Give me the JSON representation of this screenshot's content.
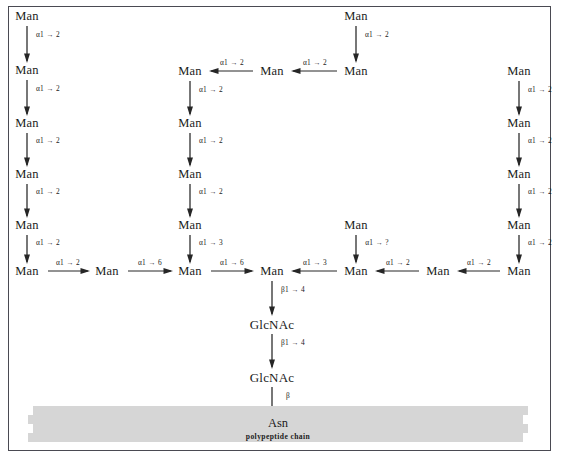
{
  "figure": {
    "frame_color": "#4a4a52",
    "background_color": "#ffffff",
    "text_color": "#1b1b1b",
    "polypeptide_bar_color": "#d6d6d6"
  },
  "polypeptide": {
    "asn_label": "Asn",
    "chain_label": "polypeptide chain"
  },
  "residues": [
    {
      "id": "L1",
      "label": "Man",
      "x": 27,
      "y": 16
    },
    {
      "id": "L2",
      "label": "Man",
      "x": 27,
      "y": 70
    },
    {
      "id": "L3",
      "label": "Man",
      "x": 27,
      "y": 123
    },
    {
      "id": "L4",
      "label": "Man",
      "x": 27,
      "y": 174
    },
    {
      "id": "L5",
      "label": "Man",
      "x": 27,
      "y": 225
    },
    {
      "id": "L6",
      "label": "Man",
      "x": 27,
      "y": 271
    },
    {
      "id": "B1",
      "label": "Man",
      "x": 107,
      "y": 271
    },
    {
      "id": "M1",
      "label": "Man",
      "x": 190,
      "y": 71
    },
    {
      "id": "M2",
      "label": "Man",
      "x": 190,
      "y": 123
    },
    {
      "id": "M3",
      "label": "Man",
      "x": 190,
      "y": 174
    },
    {
      "id": "M4",
      "label": "Man",
      "x": 190,
      "y": 225
    },
    {
      "id": "M5",
      "label": "Man",
      "x": 190,
      "y": 271
    },
    {
      "id": "T1",
      "label": "Man",
      "x": 272,
      "y": 71
    },
    {
      "id": "T2",
      "label": "Man",
      "x": 356,
      "y": 71
    },
    {
      "id": "T0",
      "label": "Man",
      "x": 356,
      "y": 16
    },
    {
      "id": "C1",
      "label": "Man",
      "x": 272,
      "y": 271
    },
    {
      "id": "C2",
      "label": "GlcNAc",
      "x": 272,
      "y": 324
    },
    {
      "id": "C3",
      "label": "GlcNAc",
      "x": 272,
      "y": 377
    },
    {
      "id": "R1",
      "label": "Man",
      "x": 356,
      "y": 271
    },
    {
      "id": "R0",
      "label": "Man",
      "x": 356,
      "y": 225
    },
    {
      "id": "R2",
      "label": "Man",
      "x": 438,
      "y": 271
    },
    {
      "id": "RR1",
      "label": "Man",
      "x": 519,
      "y": 271
    },
    {
      "id": "RR2",
      "label": "Man",
      "x": 519,
      "y": 225
    },
    {
      "id": "RR3",
      "label": "Man",
      "x": 519,
      "y": 174
    },
    {
      "id": "RR4",
      "label": "Man",
      "x": 519,
      "y": 123
    },
    {
      "id": "RR5",
      "label": "Man",
      "x": 519,
      "y": 71
    }
  ],
  "linkages": [
    {
      "from": "L1",
      "to": "L2",
      "label": "α1 → 2",
      "dir": "down",
      "x1": 27,
      "y1": 26,
      "x2": 27,
      "y2": 61,
      "lx": 48,
      "ly": 35
    },
    {
      "from": "L2",
      "to": "L3",
      "label": "α1 → 2",
      "dir": "down",
      "x1": 27,
      "y1": 80,
      "x2": 27,
      "y2": 114,
      "lx": 48,
      "ly": 89
    },
    {
      "from": "L3",
      "to": "L4",
      "label": "α1 → 2",
      "dir": "down",
      "x1": 27,
      "y1": 133,
      "x2": 27,
      "y2": 165,
      "lx": 48,
      "ly": 141
    },
    {
      "from": "L4",
      "to": "L5",
      "label": "α1 → 2",
      "dir": "down",
      "x1": 27,
      "y1": 184,
      "x2": 27,
      "y2": 216,
      "lx": 48,
      "ly": 192
    },
    {
      "from": "L5",
      "to": "L6",
      "label": "α1 → 2",
      "dir": "down",
      "x1": 27,
      "y1": 235,
      "x2": 27,
      "y2": 262,
      "lx": 48,
      "ly": 243
    },
    {
      "from": "L6",
      "to": "B1",
      "label": "α1 → 2",
      "dir": "right",
      "x1": 48,
      "y1": 271,
      "x2": 88,
      "y2": 271,
      "lx": 68,
      "ly": 263
    },
    {
      "from": "B1",
      "to": "M5",
      "label": "α1 → 6",
      "dir": "right",
      "x1": 128,
      "y1": 271,
      "x2": 171,
      "y2": 271,
      "lx": 150,
      "ly": 263
    },
    {
      "from": "M5",
      "to": "C1",
      "label": "α1 → 6",
      "dir": "right",
      "x1": 211,
      "y1": 271,
      "x2": 252,
      "y2": 271,
      "lx": 232,
      "ly": 263
    },
    {
      "from": "M1",
      "to": "M2",
      "label": "α1 → 2",
      "dir": "down",
      "x1": 190,
      "y1": 81,
      "x2": 190,
      "y2": 114,
      "lx": 211,
      "ly": 90
    },
    {
      "from": "M2",
      "to": "M3",
      "label": "α1 → 2",
      "dir": "down",
      "x1": 190,
      "y1": 133,
      "x2": 190,
      "y2": 165,
      "lx": 211,
      "ly": 141
    },
    {
      "from": "M3",
      "to": "M4",
      "label": "α1 → 2",
      "dir": "down",
      "x1": 190,
      "y1": 184,
      "x2": 190,
      "y2": 216,
      "lx": 211,
      "ly": 192
    },
    {
      "from": "M4",
      "to": "M5",
      "label": "α1 → 3",
      "dir": "down",
      "x1": 190,
      "y1": 235,
      "x2": 190,
      "y2": 262,
      "lx": 211,
      "ly": 243
    },
    {
      "from": "T1",
      "to": "M1",
      "label": "α1 → 2",
      "dir": "left",
      "x1": 253,
      "y1": 71,
      "x2": 211,
      "y2": 71,
      "lx": 232,
      "ly": 63
    },
    {
      "from": "T2",
      "to": "T1",
      "label": "α1 → 2",
      "dir": "left",
      "x1": 337,
      "y1": 71,
      "x2": 293,
      "y2": 71,
      "lx": 315,
      "ly": 63
    },
    {
      "from": "T0",
      "to": "T2",
      "label": "α1 → 2",
      "dir": "down",
      "x1": 356,
      "y1": 26,
      "x2": 356,
      "y2": 61,
      "lx": 377,
      "ly": 35
    },
    {
      "from": "C1",
      "to": "C2",
      "label": "β1 → 4",
      "dir": "down",
      "x1": 272,
      "y1": 281,
      "x2": 272,
      "y2": 314,
      "lx": 293,
      "ly": 290
    },
    {
      "from": "C2",
      "to": "C3",
      "label": "β1 → 4",
      "dir": "down",
      "x1": 272,
      "y1": 334,
      "x2": 272,
      "y2": 367,
      "lx": 293,
      "ly": 343
    },
    {
      "from": "C3",
      "to": "Asn",
      "label": "β",
      "dir": "down",
      "x1": 272,
      "y1": 387,
      "x2": 272,
      "y2": 414,
      "lx": 288,
      "ly": 396
    },
    {
      "from": "R1",
      "to": "C1",
      "label": "α1 → 3",
      "dir": "left",
      "x1": 337,
      "y1": 271,
      "x2": 293,
      "y2": 271,
      "lx": 315,
      "ly": 263
    },
    {
      "from": "R0",
      "to": "R1",
      "label": "α1 → ?",
      "dir": "down",
      "x1": 356,
      "y1": 235,
      "x2": 356,
      "y2": 262,
      "lx": 377,
      "ly": 243
    },
    {
      "from": "R2",
      "to": "R1",
      "label": "α1 → 2",
      "dir": "left",
      "x1": 419,
      "y1": 271,
      "x2": 377,
      "y2": 271,
      "lx": 398,
      "ly": 263
    },
    {
      "from": "RR1",
      "to": "R2",
      "label": "α1 → 2",
      "dir": "left",
      "x1": 500,
      "y1": 271,
      "x2": 459,
      "y2": 271,
      "lx": 479,
      "ly": 263
    },
    {
      "from": "RR5",
      "to": "RR4",
      "label": "α1 → 2",
      "dir": "down",
      "x1": 519,
      "y1": 81,
      "x2": 519,
      "y2": 114,
      "lx": 540,
      "ly": 90
    },
    {
      "from": "RR4",
      "to": "RR3",
      "label": "α1 → 2",
      "dir": "down",
      "x1": 519,
      "y1": 133,
      "x2": 519,
      "y2": 165,
      "lx": 540,
      "ly": 141
    },
    {
      "from": "RR3",
      "to": "RR2",
      "label": "α1 → 2",
      "dir": "down",
      "x1": 519,
      "y1": 184,
      "x2": 519,
      "y2": 216,
      "lx": 540,
      "ly": 192
    },
    {
      "from": "RR2",
      "to": "RR1",
      "label": "α1 → 2",
      "dir": "down",
      "x1": 519,
      "y1": 235,
      "x2": 519,
      "y2": 262,
      "lx": 540,
      "ly": 243
    }
  ]
}
